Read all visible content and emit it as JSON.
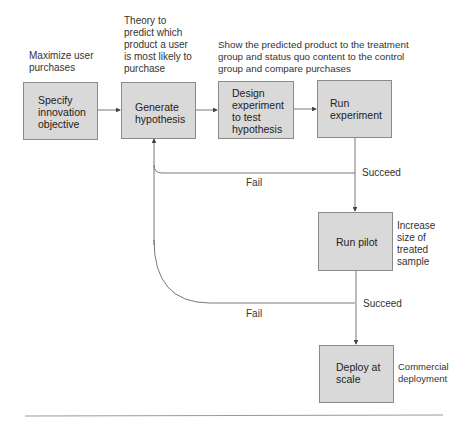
{
  "boxes": [
    {
      "id": "specify",
      "label": "Specify\ninnovation\nobjective"
    },
    {
      "id": "generate",
      "label": "Generate\nhypothesis"
    },
    {
      "id": "design",
      "label": "Design\nexperiment\nto test\nhypothesis"
    },
    {
      "id": "run_experiment",
      "label": "Run\nexperiment"
    },
    {
      "id": "run_pilot",
      "label": "Run pilot"
    },
    {
      "id": "deploy",
      "label": "Deploy at\nscale"
    }
  ],
  "annotations": {
    "specify": "Maximize user\npurchases",
    "generate": "Theory to\npredict which\nproduct a user\nis most likely to\npurchase",
    "design": "Show the predicted product to the treatment\ngroup and status quo content to the control\ngroup and compare purchases",
    "run_pilot": "Increase\nsize of\ntreated\nsample",
    "deploy": "Commercial\ndeployment"
  },
  "edge_labels": {
    "fail_1": "Fail",
    "succeed_1": "Succeed",
    "fail_2": "Fail",
    "succeed_2": "Succeed"
  },
  "colors": {
    "box_fill": "#d9d9d9",
    "box_border": "#8a8a8a",
    "line": "#555555"
  }
}
